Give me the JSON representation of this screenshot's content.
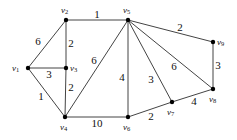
{
  "graph": {
    "colors": {
      "edge": "#444444",
      "node": "#000000",
      "text": "#111111"
    },
    "nodes": [
      {
        "id": "v1",
        "name": "v",
        "sub": "1",
        "x": 28,
        "y": 68,
        "lx": 12,
        "ly": 69
      },
      {
        "id": "v2",
        "name": "v",
        "sub": "2",
        "x": 66,
        "y": 20,
        "lx": 61,
        "ly": 11
      },
      {
        "id": "v3",
        "name": "v",
        "sub": "3",
        "x": 66,
        "y": 68,
        "lx": 70,
        "ly": 69
      },
      {
        "id": "v4",
        "name": "v",
        "sub": "4",
        "x": 65,
        "y": 117,
        "lx": 60,
        "ly": 128
      },
      {
        "id": "v5",
        "name": "v",
        "sub": "5",
        "x": 128,
        "y": 20,
        "lx": 123,
        "ly": 11
      },
      {
        "id": "v6",
        "name": "v",
        "sub": "6",
        "x": 128,
        "y": 117,
        "lx": 123,
        "ly": 128
      },
      {
        "id": "v7",
        "name": "v",
        "sub": "7",
        "x": 172,
        "y": 102,
        "lx": 167,
        "ly": 113
      },
      {
        "id": "v8",
        "name": "v",
        "sub": "8",
        "x": 213,
        "y": 89,
        "lx": 209,
        "ly": 100
      },
      {
        "id": "v9",
        "name": "v",
        "sub": "9",
        "x": 213,
        "y": 42,
        "lx": 217,
        "ly": 43
      }
    ],
    "edges": [
      {
        "from": "v1",
        "to": "v2",
        "weight": "6",
        "lx": 38,
        "ly": 42
      },
      {
        "from": "v1",
        "to": "v3",
        "weight": "3",
        "lx": 49,
        "ly": 75
      },
      {
        "from": "v1",
        "to": "v4",
        "weight": "1",
        "lx": 41,
        "ly": 97
      },
      {
        "from": "v2",
        "to": "v3",
        "weight": "2",
        "lx": 71,
        "ly": 44
      },
      {
        "from": "v3",
        "to": "v4",
        "weight": "2",
        "lx": 71,
        "ly": 88
      },
      {
        "from": "v2",
        "to": "v5",
        "weight": "1",
        "lx": 97,
        "ly": 15
      },
      {
        "from": "v4",
        "to": "v5",
        "weight": "6",
        "lx": 94,
        "ly": 61
      },
      {
        "from": "v4",
        "to": "v6",
        "weight": "10",
        "lx": 97,
        "ly": 124
      },
      {
        "from": "v5",
        "to": "v6",
        "weight": "4",
        "lx": 122,
        "ly": 78
      },
      {
        "from": "v5",
        "to": "v7",
        "weight": "3",
        "lx": 151,
        "ly": 80
      },
      {
        "from": "v5",
        "to": "v8",
        "weight": "6",
        "lx": 174,
        "ly": 67
      },
      {
        "from": "v5",
        "to": "v9",
        "weight": "2",
        "lx": 180,
        "ly": 28
      },
      {
        "from": "v9",
        "to": "v8",
        "weight": "3",
        "lx": 218,
        "ly": 66
      },
      {
        "from": "v6",
        "to": "v7",
        "weight": "2",
        "lx": 151,
        "ly": 117
      },
      {
        "from": "v7",
        "to": "v8",
        "weight": "4",
        "lx": 194,
        "ly": 102
      }
    ]
  }
}
